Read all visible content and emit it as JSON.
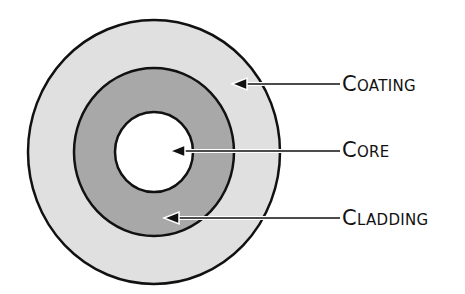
{
  "diagram": {
    "type": "concentric-cross-section",
    "colors": {
      "coating_fill": "#e0e0e0",
      "cladding_fill": "#a8a8a8",
      "core_fill": "#ffffff",
      "outline": "#111111",
      "arrow": "#111111"
    },
    "layers": [
      {
        "id": "coating",
        "label": "Coating",
        "cx": 154,
        "cy": 152,
        "rx": 126,
        "ry": 132
      },
      {
        "id": "cladding",
        "label": "Cladding",
        "cx": 154,
        "cy": 152,
        "rx": 80,
        "ry": 84
      },
      {
        "id": "core",
        "label": "Core",
        "cx": 154,
        "cy": 152,
        "rx": 39,
        "ry": 40
      }
    ],
    "labels": {
      "coating": "Coating",
      "core": "Core",
      "cladding": "Cladding"
    },
    "arrows": [
      {
        "target": "coating",
        "tip_x": 232,
        "y": 84,
        "tail_x": 340
      },
      {
        "target": "core",
        "tip_x": 170,
        "y": 151,
        "tail_x": 340
      },
      {
        "target": "cladding",
        "tip_x": 164,
        "y": 218,
        "tail_x": 340
      }
    ]
  }
}
